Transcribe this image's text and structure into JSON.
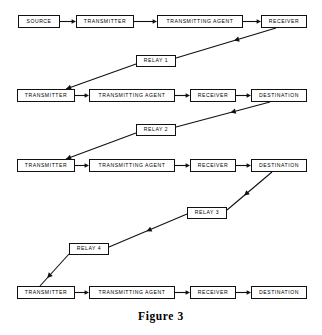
{
  "figure": {
    "caption": "Figure 3",
    "caption_top": 310,
    "background": "#ffffff",
    "line_color": "#111111"
  },
  "rows": [
    {
      "id": "row-1",
      "nodes": [
        {
          "id": "r1-source",
          "label": "SOURCE",
          "x": 18,
          "y": 15,
          "w": 42,
          "h": 13
        },
        {
          "id": "r1-transmitter",
          "label": "TRANSMITTER",
          "x": 76,
          "y": 15,
          "w": 58,
          "h": 13
        },
        {
          "id": "r1-transmitting-agent",
          "label": "TRANSMITTING AGENT",
          "x": 157,
          "y": 15,
          "w": 86,
          "h": 13
        },
        {
          "id": "r1-receiver",
          "label": "RECEIVER",
          "x": 261,
          "y": 15,
          "w": 46,
          "h": 13
        }
      ]
    },
    {
      "id": "row-2",
      "nodes": [
        {
          "id": "r2-transmitter",
          "label": "TRANSMITTER",
          "x": 17,
          "y": 89,
          "w": 58,
          "h": 13
        },
        {
          "id": "r2-transmitting-agent",
          "label": "TRANSMITTING AGENT",
          "x": 89,
          "y": 89,
          "w": 86,
          "h": 13
        },
        {
          "id": "r2-receiver",
          "label": "RECEIVER",
          "x": 190,
          "y": 89,
          "w": 46,
          "h": 13
        },
        {
          "id": "r2-destination",
          "label": "DESTINATION",
          "x": 251,
          "y": 89,
          "w": 56,
          "h": 13
        }
      ]
    },
    {
      "id": "row-3",
      "nodes": [
        {
          "id": "r3-transmitter",
          "label": "TRANSMITTER",
          "x": 17,
          "y": 159,
          "w": 58,
          "h": 13
        },
        {
          "id": "r3-transmitting-agent",
          "label": "TRANSMITTING AGENT",
          "x": 89,
          "y": 159,
          "w": 86,
          "h": 13
        },
        {
          "id": "r3-receiver",
          "label": "RECEIVER",
          "x": 190,
          "y": 159,
          "w": 46,
          "h": 13
        },
        {
          "id": "r3-destination",
          "label": "DESTINATION",
          "x": 251,
          "y": 159,
          "w": 56,
          "h": 13
        }
      ]
    },
    {
      "id": "row-4",
      "nodes": [
        {
          "id": "r4-transmitter",
          "label": "TRANSMITTER",
          "x": 17,
          "y": 286,
          "w": 58,
          "h": 13
        },
        {
          "id": "r4-transmitting-agent",
          "label": "TRANSMITTING AGENT",
          "x": 89,
          "y": 286,
          "w": 86,
          "h": 13
        },
        {
          "id": "r4-receiver",
          "label": "RECEIVER",
          "x": 190,
          "y": 286,
          "w": 46,
          "h": 13
        },
        {
          "id": "r4-destination",
          "label": "DESTINATION",
          "x": 251,
          "y": 286,
          "w": 56,
          "h": 13
        }
      ]
    }
  ],
  "relays": [
    {
      "id": "relay-1",
      "label": "RELAY 1",
      "x": 136,
      "y": 55,
      "w": 40,
      "h": 12
    },
    {
      "id": "relay-2",
      "label": "RELAY 2",
      "x": 136,
      "y": 124,
      "w": 40,
      "h": 12
    },
    {
      "id": "relay-3",
      "label": "RELAY 3",
      "x": 187,
      "y": 207,
      "w": 40,
      "h": 12
    },
    {
      "id": "relay-4",
      "label": "RELAY 4",
      "x": 69,
      "y": 243,
      "w": 40,
      "h": 12
    }
  ],
  "horizontal_arrows": [
    {
      "id": "a-r1-1",
      "x1": 60,
      "x2": 76,
      "y": 21.5
    },
    {
      "id": "a-r1-2",
      "x1": 134,
      "x2": 157,
      "y": 21.5
    },
    {
      "id": "a-r1-3",
      "x1": 243,
      "x2": 261,
      "y": 21.5
    },
    {
      "id": "a-r2-1",
      "x1": 75,
      "x2": 89,
      "y": 95.5
    },
    {
      "id": "a-r2-2",
      "x1": 175,
      "x2": 190,
      "y": 95.5
    },
    {
      "id": "a-r2-3",
      "x1": 236,
      "x2": 251,
      "y": 95.5
    },
    {
      "id": "a-r3-1",
      "x1": 75,
      "x2": 89,
      "y": 165.5
    },
    {
      "id": "a-r3-2",
      "x1": 175,
      "x2": 190,
      "y": 165.5
    },
    {
      "id": "a-r3-3",
      "x1": 236,
      "x2": 251,
      "y": 165.5
    },
    {
      "id": "a-r4-1",
      "x1": 75,
      "x2": 89,
      "y": 292.5
    },
    {
      "id": "a-r4-2",
      "x1": 175,
      "x2": 190,
      "y": 292.5
    },
    {
      "id": "a-r4-3",
      "x1": 236,
      "x2": 251,
      "y": 292.5
    }
  ],
  "relay_links": [
    {
      "id": "link-receiver1-to-relay1",
      "from": "r1-receiver",
      "to": "relay-1",
      "x1": 276,
      "y1": 28,
      "x2": 176,
      "y2": 58,
      "arrow_at": 0.42
    },
    {
      "id": "link-relay1-to-transmitter2",
      "from": "relay-1",
      "to": "r2-transmitter",
      "x1": 136,
      "y1": 64,
      "x2": 66,
      "y2": 89,
      "arrow_at": 1.0
    },
    {
      "id": "link-destination2-to-relay2",
      "from": "r2-destination",
      "to": "relay-2",
      "x1": 270,
      "y1": 102,
      "x2": 176,
      "y2": 127,
      "arrow_at": 0.42
    },
    {
      "id": "link-relay2-to-transmitter3",
      "from": "relay-2",
      "to": "r3-transmitter",
      "x1": 136,
      "y1": 133,
      "x2": 66,
      "y2": 159,
      "arrow_at": 1.0
    },
    {
      "id": "link-destination3-to-relay3",
      "from": "r3-destination",
      "to": "relay-3",
      "x1": 272,
      "y1": 172,
      "x2": 227,
      "y2": 210,
      "arrow_at": 0.62
    },
    {
      "id": "link-relay3-to-relay4",
      "from": "relay-3",
      "to": "relay-4",
      "x1": 187,
      "y1": 214,
      "x2": 109,
      "y2": 247,
      "arrow_at": 0.52
    },
    {
      "id": "link-relay4-to-transmitter4",
      "from": "relay-4",
      "to": "r4-transmitter",
      "x1": 69,
      "y1": 254,
      "x2": 40,
      "y2": 286,
      "arrow_at": 0.75
    }
  ]
}
